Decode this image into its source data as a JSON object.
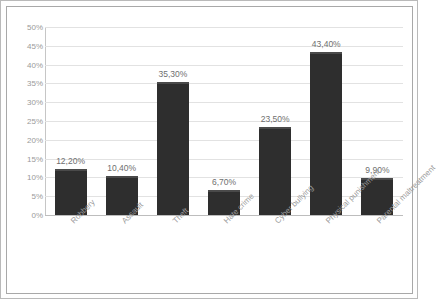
{
  "chart_data": {
    "type": "bar",
    "title": "",
    "subtitle": "",
    "xlabel": "",
    "ylabel": "",
    "categories": [
      "Robbery",
      "Assault",
      "Theft",
      "Hate crime",
      "Cyber bullying",
      "Physical punishment",
      "Parental maltreatment"
    ],
    "values": [
      12.2,
      10.4,
      35.3,
      6.7,
      23.5,
      43.4,
      9.9
    ],
    "value_labels": [
      "12,20%",
      "10,40%",
      "35,30%",
      "6,70%",
      "23,50%",
      "43,40%",
      "9,90%"
    ],
    "ylim": [
      0,
      50
    ],
    "ytick_values": [
      0,
      5,
      10,
      15,
      20,
      25,
      30,
      35,
      40,
      45,
      50
    ],
    "ytick_labels": [
      "0%",
      "5%",
      "10%",
      "15%",
      "20%",
      "25%",
      "30%",
      "35%",
      "40%",
      "45%",
      "50%"
    ],
    "grid": true,
    "legend": false,
    "legend_position": "none",
    "bar_color": "#2e2e2e",
    "grid_color": "#e2e2e2",
    "axis_text_color": "#9a9a9a",
    "value_label_color": "#6f6f6f",
    "category_label_rotation": -45
  }
}
